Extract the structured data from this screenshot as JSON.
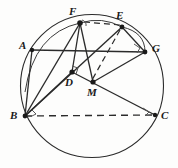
{
  "figure": {
    "kind": "euclidean-geometry-diagram",
    "width": 178,
    "height": 168,
    "stroke_color": "#2b2b2b",
    "background_color": "#fdfdfc",
    "label_color": "#1a1a1a"
  },
  "circle": {
    "name": "circumcircle",
    "cx": 92,
    "cy": 86,
    "r": 71.5
  },
  "points": [
    {
      "id": "A",
      "label": "A",
      "x": 32,
      "y": 50,
      "label_x": 19,
      "label_y": 40,
      "dot": true
    },
    {
      "id": "B",
      "label": "B",
      "x": 25,
      "y": 116,
      "label_x": 10,
      "label_y": 110,
      "dot": true
    },
    {
      "id": "C",
      "label": "C",
      "x": 155,
      "y": 115,
      "label_x": 161,
      "label_y": 110,
      "dot": true
    },
    {
      "id": "D",
      "label": "D",
      "x": 72,
      "y": 72,
      "label_x": 65,
      "label_y": 77,
      "dot": true
    },
    {
      "id": "E",
      "label": "E",
      "x": 122,
      "y": 27,
      "label_x": 116,
      "label_y": 10,
      "dot": true
    },
    {
      "id": "F",
      "label": "F",
      "x": 80,
      "y": 23,
      "label_x": 69,
      "label_y": 6,
      "dot": true
    },
    {
      "id": "G",
      "label": "G",
      "x": 145,
      "y": 52,
      "label_x": 152,
      "label_y": 43,
      "dot": true
    },
    {
      "id": "M",
      "label": "M",
      "x": 93,
      "y": 82,
      "label_x": 87,
      "label_y": 87,
      "dot": true
    }
  ],
  "segments": [
    {
      "name": "A-G-chord",
      "from": "A",
      "to": "G",
      "style": "solid"
    },
    {
      "name": "A-B-side",
      "from": "A",
      "to": "B",
      "style": "solid"
    },
    {
      "name": "B-F",
      "from": "B",
      "to": "F",
      "style": "solid"
    },
    {
      "name": "B-D",
      "from": "B",
      "to": "D",
      "style": "solid"
    },
    {
      "name": "B-E",
      "from": "B",
      "to": "E",
      "style": "solid"
    },
    {
      "name": "B-M-C",
      "from": "B",
      "to": "C",
      "style": "dashed"
    },
    {
      "name": "F-D",
      "from": "F",
      "to": "D",
      "style": "solid"
    },
    {
      "name": "F-M",
      "from": "F",
      "to": "M",
      "style": "solid"
    },
    {
      "name": "F-E",
      "from": "F",
      "to": "E",
      "style": "dashed"
    },
    {
      "name": "E-M",
      "from": "E",
      "to": "M",
      "style": "dashed"
    },
    {
      "name": "E-G",
      "from": "E",
      "to": "G",
      "style": "solid"
    },
    {
      "name": "D-M-C",
      "from": "D",
      "to": "C",
      "style": "solid"
    },
    {
      "name": "G-M",
      "from": "G",
      "to": "M",
      "style": "solid"
    }
  ],
  "arcs": [
    {
      "name": "arc-A-F",
      "note": "arc of circle through A and F"
    },
    {
      "name": "arc-F-E",
      "note": "small arc joining F to E"
    },
    {
      "name": "arc-E-G",
      "note": "arc bulging from E down to G"
    }
  ],
  "right_angle_marks": [
    {
      "name": "right-angle-at-D",
      "at": "D"
    },
    {
      "name": "right-angle-at-B",
      "at": "B"
    },
    {
      "name": "right-angle-at-C",
      "at": "C"
    },
    {
      "name": "right-angle-at-G",
      "at": "G"
    },
    {
      "name": "right-angle-at-F",
      "at": "F"
    }
  ]
}
